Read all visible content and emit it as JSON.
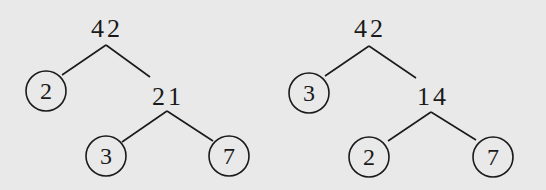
{
  "diagram": {
    "background": "#e9e9e9",
    "stroke": "#1a1a1a",
    "trees": [
      {
        "name": "factor-tree-left",
        "root": {
          "label": "42",
          "x": 107,
          "y": 37
        },
        "edges": [
          {
            "x1": 106,
            "y1": 45,
            "x2": 62,
            "y2": 75
          },
          {
            "x1": 106,
            "y1": 45,
            "x2": 150,
            "y2": 77
          },
          {
            "x1": 167,
            "y1": 111,
            "x2": 122,
            "y2": 142
          },
          {
            "x1": 167,
            "y1": 111,
            "x2": 213,
            "y2": 141
          }
        ],
        "inner": [
          {
            "label": "21",
            "x": 168,
            "y": 105
          }
        ],
        "leaves": [
          {
            "label": "2",
            "cx": 46,
            "cy": 91,
            "r": 20
          },
          {
            "label": "3",
            "cx": 106,
            "cy": 156,
            "r": 20
          },
          {
            "label": "7",
            "cx": 229,
            "cy": 156,
            "r": 20
          }
        ]
      },
      {
        "name": "factor-tree-right",
        "root": {
          "label": "42",
          "x": 370,
          "y": 37
        },
        "edges": [
          {
            "x1": 369,
            "y1": 46,
            "x2": 325,
            "y2": 76
          },
          {
            "x1": 369,
            "y1": 46,
            "x2": 416,
            "y2": 78
          },
          {
            "x1": 431,
            "y1": 112,
            "x2": 388,
            "y2": 141
          },
          {
            "x1": 431,
            "y1": 112,
            "x2": 476,
            "y2": 140
          }
        ],
        "inner": [
          {
            "label": "14",
            "x": 433,
            "y": 105
          }
        ],
        "leaves": [
          {
            "label": "3",
            "cx": 309,
            "cy": 93,
            "r": 20
          },
          {
            "label": "2",
            "cx": 369,
            "cy": 157,
            "r": 20
          },
          {
            "label": "7",
            "cx": 493,
            "cy": 157,
            "r": 20
          }
        ]
      }
    ]
  }
}
